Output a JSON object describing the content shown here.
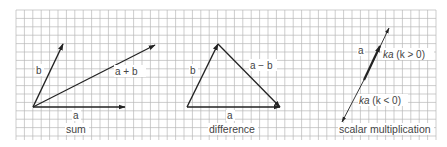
{
  "figure": {
    "background": "#ffffff",
    "grid": {
      "x0": 16,
      "y0": 10,
      "x1": 436,
      "y1": 140,
      "cell": 8.4,
      "color": "#b8b8b8"
    },
    "vector_color": "#222222"
  },
  "panels": [
    {
      "id": "sum",
      "caption": "sum",
      "vectors": [
        {
          "name": "a",
          "label": "a",
          "from": [
            33,
            107
          ],
          "to": [
            125,
            107
          ],
          "arrow": "end"
        },
        {
          "name": "b",
          "label": "b",
          "from": [
            33,
            107
          ],
          "to": [
            63,
            44
          ],
          "arrow": "end"
        },
        {
          "name": "a_plus_b",
          "label": "a + b",
          "from": [
            33,
            107
          ],
          "to": [
            155,
            45
          ],
          "arrow": "end"
        }
      ]
    },
    {
      "id": "difference",
      "caption": "difference",
      "vectors": [
        {
          "name": "a",
          "label": "a",
          "from": [
            187,
            107
          ],
          "to": [
            280,
            107
          ],
          "arrow": "end"
        },
        {
          "name": "b",
          "label": "b",
          "from": [
            187,
            107
          ],
          "to": [
            218,
            44
          ],
          "arrow": "end"
        },
        {
          "name": "a_minus_b",
          "label": "a − b",
          "from": [
            218,
            44
          ],
          "to": [
            280,
            107
          ],
          "arrow": "end"
        }
      ]
    },
    {
      "id": "scalar",
      "caption": "scalar multiplication",
      "vectors": [
        {
          "name": "ka_pos",
          "label": "ka (k > 0)",
          "from": [
            366,
            76
          ],
          "to": [
            389,
            28
          ],
          "arrow": "end"
        },
        {
          "name": "a",
          "label": "a",
          "from": [
            366,
            76
          ],
          "to": [
            380,
            46
          ],
          "arrow": "end"
        },
        {
          "name": "ka_neg",
          "label": "ka (k < 0)",
          "from": [
            366,
            76
          ],
          "to": [
            342,
            122
          ],
          "arrow": "end"
        }
      ]
    }
  ],
  "labels": {
    "sum_b": "b",
    "sum_apb": "a + b",
    "sum_a": "a",
    "sum_caption": "sum",
    "diff_b": "b",
    "diff_amb": "a − b",
    "diff_a": "a",
    "diff_caption": "difference",
    "scal_a": "a",
    "scal_kpos_k": "ka",
    "scal_kpos_cond": " (k > 0)",
    "scal_kneg_k": "ka",
    "scal_kneg_cond": " (k < 0)",
    "scal_caption": "scalar multiplication"
  }
}
